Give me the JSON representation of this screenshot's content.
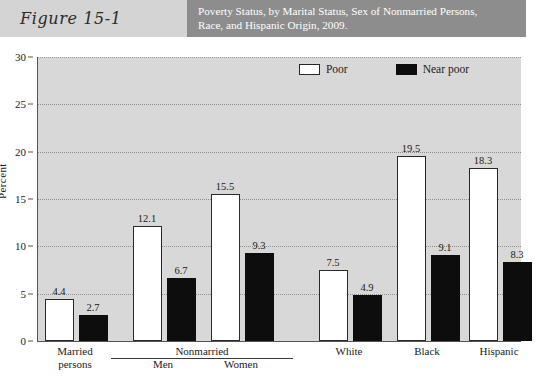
{
  "header": {
    "figure_label": "Figure 15-1",
    "title_line1": "Poverty Status, by Marital Status, Sex of Nonmarried Persons,",
    "title_line2": "Race, and Hispanic Origin, 2009."
  },
  "chart_data": {
    "type": "bar",
    "title": "Poverty Status, by Marital Status, Sex of Nonmarried Persons, Race, and Hispanic Origin, 2009.",
    "xlabel": "",
    "ylabel": "Percent",
    "ylim": [
      0,
      30
    ],
    "yticks": [
      0,
      5,
      10,
      15,
      20,
      25,
      30
    ],
    "grid": true,
    "legend_position": "top-right",
    "categories": [
      "Married persons",
      "Men",
      "Women",
      "White",
      "Black",
      "Hispanic"
    ],
    "group_bracket": {
      "label": "Nonmarried",
      "covers": [
        "Men",
        "Women"
      ]
    },
    "series": [
      {
        "name": "Poor",
        "color": "#ffffff",
        "values": [
          4.4,
          12.1,
          15.5,
          7.5,
          19.5,
          18.3
        ]
      },
      {
        "name": "Near poor",
        "color": "#0d0d0d",
        "values": [
          2.7,
          6.7,
          9.3,
          4.9,
          9.1,
          8.3
        ]
      }
    ],
    "value_labels": [
      "4.4",
      "2.7",
      "12.1",
      "6.7",
      "15.5",
      "9.3",
      "7.5",
      "4.9",
      "19.5",
      "9.1",
      "18.3",
      "8.3"
    ]
  },
  "xaxis": {
    "labels": [
      {
        "line1": "Married",
        "line2": "persons"
      },
      {
        "line1": "Men",
        "line2": ""
      },
      {
        "line1": "Women",
        "line2": ""
      },
      {
        "line1": "White",
        "line2": ""
      },
      {
        "line1": "Black",
        "line2": ""
      },
      {
        "line1": "Hispanic",
        "line2": ""
      }
    ]
  },
  "yaxis": {
    "title": "Percent",
    "ticks": [
      "30",
      "25",
      "20",
      "15",
      "10",
      "5",
      "0"
    ]
  },
  "legend": {
    "items": [
      {
        "label": "Poor",
        "swatch": "white-square-icon"
      },
      {
        "label": "Near poor",
        "swatch": "black-square-icon"
      }
    ]
  }
}
